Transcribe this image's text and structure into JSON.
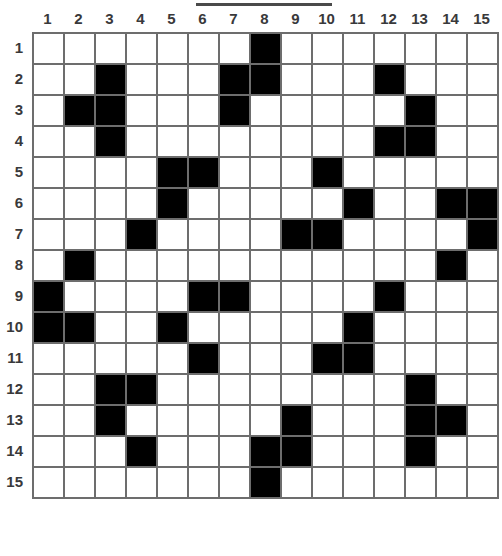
{
  "puzzle": {
    "title": "",
    "grid_size": 15,
    "column_headers": [
      "1",
      "2",
      "3",
      "4",
      "5",
      "6",
      "7",
      "8",
      "9",
      "10",
      "11",
      "12",
      "13",
      "14",
      "15"
    ],
    "row_headers": [
      "1",
      "2",
      "3",
      "4",
      "5",
      "6",
      "7",
      "8",
      "9",
      "10",
      "11",
      "12",
      "13",
      "14",
      "15"
    ],
    "colors": {
      "filled": "#000000",
      "empty": "#ffffff",
      "gridline": "#6d6d6d",
      "label": "#39393b"
    },
    "legend": {
      "filled_label": "filled",
      "empty_label": "empty"
    },
    "cells": [
      [
        0,
        0,
        0,
        0,
        0,
        0,
        0,
        1,
        0,
        0,
        0,
        0,
        0,
        0,
        0
      ],
      [
        0,
        0,
        1,
        0,
        0,
        0,
        1,
        1,
        0,
        0,
        0,
        1,
        0,
        0,
        0
      ],
      [
        0,
        1,
        1,
        0,
        0,
        0,
        1,
        0,
        0,
        0,
        0,
        0,
        1,
        0,
        0
      ],
      [
        0,
        0,
        1,
        0,
        0,
        0,
        0,
        0,
        0,
        0,
        0,
        1,
        1,
        0,
        0
      ],
      [
        0,
        0,
        0,
        0,
        1,
        1,
        0,
        0,
        0,
        1,
        0,
        0,
        0,
        0,
        0
      ],
      [
        0,
        0,
        0,
        0,
        1,
        0,
        0,
        0,
        0,
        0,
        1,
        0,
        0,
        1,
        1
      ],
      [
        0,
        0,
        0,
        1,
        0,
        0,
        0,
        0,
        1,
        1,
        0,
        0,
        0,
        0,
        1
      ],
      [
        0,
        1,
        0,
        0,
        0,
        0,
        0,
        0,
        0,
        0,
        0,
        0,
        0,
        1,
        0
      ],
      [
        1,
        0,
        0,
        0,
        0,
        1,
        1,
        0,
        0,
        0,
        0,
        1,
        0,
        0,
        0
      ],
      [
        1,
        1,
        0,
        0,
        1,
        0,
        0,
        0,
        0,
        0,
        1,
        0,
        0,
        0,
        0
      ],
      [
        0,
        0,
        0,
        0,
        0,
        1,
        0,
        0,
        0,
        1,
        1,
        0,
        0,
        0,
        0
      ],
      [
        0,
        0,
        1,
        1,
        0,
        0,
        0,
        0,
        0,
        0,
        0,
        0,
        1,
        0,
        0
      ],
      [
        0,
        0,
        1,
        0,
        0,
        0,
        0,
        0,
        1,
        0,
        0,
        0,
        1,
        1,
        0
      ],
      [
        0,
        0,
        0,
        1,
        0,
        0,
        0,
        1,
        1,
        0,
        0,
        0,
        1,
        0,
        0
      ],
      [
        0,
        0,
        0,
        0,
        0,
        0,
        0,
        1,
        0,
        0,
        0,
        0,
        0,
        0,
        0
      ]
    ]
  }
}
